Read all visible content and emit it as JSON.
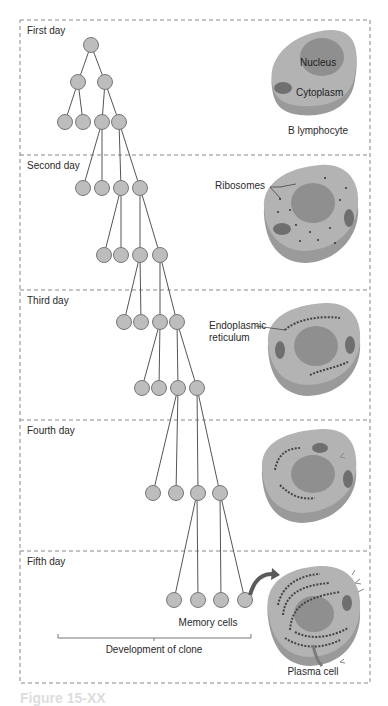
{
  "figure": {
    "caption": "Figure 15-XX",
    "colors": {
      "node_fill": "#bdbdbd",
      "node_stroke": "#777777",
      "line": "#555555",
      "dash": "#888888",
      "cell_body": "#b3b3b3",
      "cell_side": "#9a9a9a",
      "nucleus": "#8f8f8f",
      "organelle": "#6f6f6f",
      "arrow": "#5a5a5a"
    }
  },
  "panels": [
    {
      "label": "First day"
    },
    {
      "label": "Second day"
    },
    {
      "label": "Third day"
    },
    {
      "label": "Fourth day"
    },
    {
      "label": "Fifth day"
    }
  ],
  "cells": {
    "b_lymphocyte": {
      "label": "B lymphocyte",
      "nucleus_label": "Nucleus",
      "cytoplasm_label": "Cytoplasm"
    },
    "day2": {
      "callout": "Ribosomes"
    },
    "day3": {
      "callout_line1": "Endoplasmic",
      "callout_line2": "reticulum"
    },
    "plasma_cell": {
      "label": "Plasma cell"
    }
  },
  "clone": {
    "memory_label": "Memory cells",
    "bracket_label": "Development of clone"
  }
}
